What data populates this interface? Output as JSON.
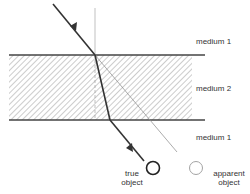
{
  "diagram": {
    "labels": {
      "medium_top": "medium 1",
      "medium_middle": "medium 2",
      "medium_bottom": "medium 1",
      "true_object_line1": "true",
      "true_object_line2": "object",
      "apparent_object_line1": "apparent",
      "apparent_object_line2": "object"
    },
    "colors": {
      "ray": "#333333",
      "thin_line": "#888888",
      "hatch": "#9a9a9a",
      "interface": "#444444"
    }
  }
}
